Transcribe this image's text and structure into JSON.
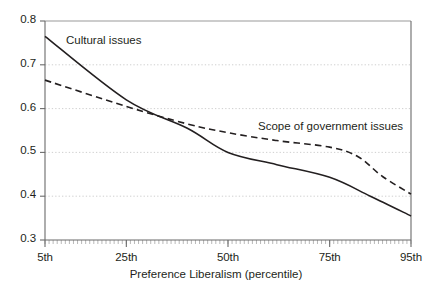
{
  "chart_data": {
    "type": "line",
    "title": "",
    "xlabel": "Preference Liberalism (percentile)",
    "ylabel": "",
    "xlim": [
      5,
      95
    ],
    "ylim": [
      0.3,
      0.8
    ],
    "grid": true,
    "legend_position": "inline-annotations",
    "xticks": [
      {
        "value": 5,
        "label": "5th"
      },
      {
        "value": 25,
        "label": "25th"
      },
      {
        "value": 50,
        "label": "50th"
      },
      {
        "value": 75,
        "label": "75th"
      },
      {
        "value": 95,
        "label": "95th"
      }
    ],
    "yticks": [
      {
        "value": 0.3,
        "label": "0.3"
      },
      {
        "value": 0.4,
        "label": "0.4"
      },
      {
        "value": 0.5,
        "label": "0.5"
      },
      {
        "value": 0.6,
        "label": "0.6"
      },
      {
        "value": 0.7,
        "label": "0.7"
      },
      {
        "value": 0.8,
        "label": "0.8"
      }
    ],
    "series": [
      {
        "name": "Cultural issues",
        "style": "solid",
        "color": "#231f20",
        "x": [
          5,
          25,
          40,
          50,
          62,
          75,
          85,
          95
        ],
        "values": [
          0.765,
          0.62,
          0.555,
          0.5,
          0.472,
          0.443,
          0.4,
          0.355
        ]
      },
      {
        "name": "Scope of government issues",
        "style": "dashed",
        "color": "#231f20",
        "x": [
          5,
          25,
          40,
          50,
          62,
          75,
          82,
          88,
          95
        ],
        "values": [
          0.665,
          0.605,
          0.565,
          0.545,
          0.527,
          0.512,
          0.49,
          0.445,
          0.405
        ]
      }
    ],
    "annotations": [
      {
        "name": "cultural-issues-label",
        "text": "Cultural issues",
        "x_px": 66,
        "y_px": 34
      },
      {
        "name": "scope-of-government-label",
        "text": "Scope of government issues",
        "x_px": 258,
        "y_px": 120
      }
    ]
  }
}
